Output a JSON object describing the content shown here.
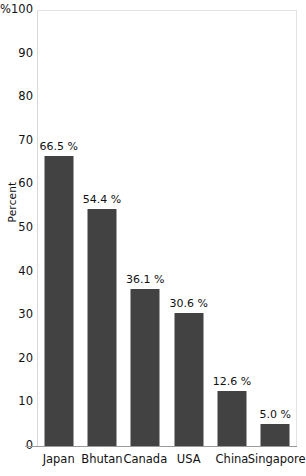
{
  "chart_data": {
    "type": "bar",
    "title": "",
    "subtitle": "",
    "xlabel": "",
    "ylabel": "Percent",
    "categories": [
      "Japan",
      "Bhutan",
      "Canada",
      "USA",
      "China",
      "Singapore"
    ],
    "values": [
      66.5,
      54.4,
      36.1,
      30.6,
      12.6,
      5.0
    ],
    "value_labels": [
      "66.5 %",
      "54.4 %",
      "36.1 %",
      "30.6 %",
      "12.6 %",
      "5.0 %"
    ],
    "ylim": [
      0,
      100
    ],
    "ytick_labels": [
      "%100",
      "90",
      "80",
      "70",
      "60",
      "50",
      "40",
      "30",
      "20",
      "10",
      "0"
    ],
    "ytick_values": [
      100,
      90,
      80,
      70,
      60,
      50,
      40,
      30,
      20,
      10,
      0
    ],
    "grid": false,
    "legend": false,
    "bar_color": "#424242",
    "frame_color": "#e3e3e3",
    "background_color": "#ffffff",
    "text_color": "#111111"
  }
}
